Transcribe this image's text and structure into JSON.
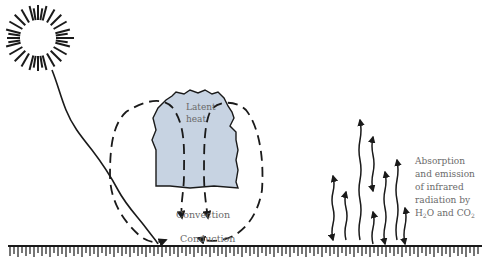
{
  "diagram": {
    "labels": {
      "latent_heat_line1": "Latent",
      "latent_heat_line2": "heat",
      "convection": "Convection",
      "conduction": "Conduction",
      "absorption_line1": "Absorption",
      "absorption_line2": "and emission",
      "absorption_line3": "of infrared",
      "absorption_line4": "radiation by",
      "absorption_line5_a": "H",
      "absorption_line5_sub1": "2",
      "absorption_line5_b": "O and CO",
      "absorption_line5_sub2": "2"
    },
    "colors": {
      "cloud_fill": "#c7d3e2",
      "ink": "#1a1a1a",
      "label": "#6a6a6a"
    }
  }
}
